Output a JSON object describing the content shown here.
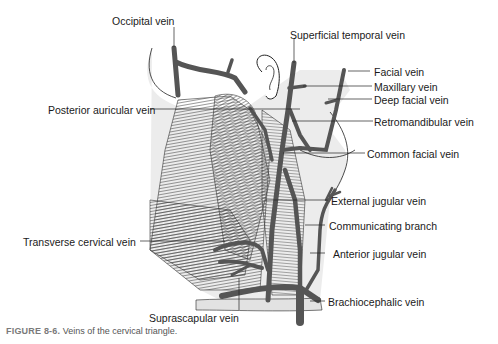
{
  "figure": {
    "title": "Veins of the cervical triangle",
    "caption_number": "FIGURE 8-6.",
    "caption_text": "Veins of the cervical triangle.",
    "labels": {
      "occipital": "Occipital vein",
      "superficial_temporal": "Superficial temporal vein",
      "facial": "Facial vein",
      "maxillary": "Maxillary vein",
      "deep_facial": "Deep facial vein",
      "posterior_auricular": "Posterior auricular vein",
      "retromandibular": "Retromandibular vein",
      "common_facial": "Common facial vein",
      "external_jugular": "External jugular vein",
      "communicating_branch": "Communicating branch",
      "transverse_cervical": "Transverse cervical vein",
      "anterior_jugular": "Anterior jugular vein",
      "suprascapular": "Suprascapular vein",
      "brachiocephalic": "Brachiocephalic vein"
    },
    "colors": {
      "vein": "#555555",
      "muscle_stroke": "#444444",
      "skin_fill": "#e6e6e6",
      "outline": "#222222",
      "caption_number": "#7a7a7a"
    }
  }
}
